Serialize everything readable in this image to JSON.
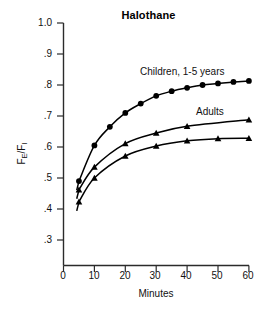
{
  "chart": {
    "title": "Halothane",
    "xlabel": "Minutes",
    "ylabel_main": "F",
    "ylabel_sub1": "E",
    "ylabel_mid": "/F",
    "ylabel_sub2": "I",
    "ylabel_full": "FE/FI"
  },
  "axes": {
    "y_ticks": [
      "1.0",
      ".9",
      ".8",
      ".7",
      ".6",
      ".5",
      ".4",
      ".3"
    ],
    "x_ticks": [
      "0",
      "10",
      "20",
      "30",
      "40",
      "50",
      "60"
    ]
  },
  "labels": {
    "children": "Children, 1-5 years",
    "adults": "Adults"
  },
  "colors": {
    "ink": "#000000",
    "axis": "#333333",
    "background": "#ffffff"
  },
  "chart_data": {
    "type": "line",
    "title": "Halothane",
    "xlabel": "Minutes",
    "ylabel": "FE/FI",
    "xlim": [
      0,
      60
    ],
    "ylim": [
      0.26,
      1.0
    ],
    "grid": false,
    "legend": "inline-annotations",
    "xticks": [
      0,
      10,
      20,
      30,
      40,
      50,
      60
    ],
    "yticks": [
      0.3,
      0.4,
      0.5,
      0.6,
      0.7,
      0.8,
      0.9,
      1.0
    ],
    "series": [
      {
        "name": "Children, 1-5 years",
        "marker": "circle",
        "x": [
          5,
          10,
          15,
          20,
          25,
          30,
          35,
          40,
          45,
          50,
          55,
          60
        ],
        "values": [
          0.49,
          0.605,
          0.665,
          0.71,
          0.74,
          0.765,
          0.78,
          0.791,
          0.8,
          0.805,
          0.81,
          0.813
        ]
      },
      {
        "name": "Adults",
        "marker": "triangle",
        "x": [
          5,
          10,
          20,
          30,
          40,
          60
        ],
        "values": [
          0.462,
          0.535,
          0.611,
          0.645,
          0.667,
          0.688
        ]
      },
      {
        "name": "Lower series",
        "marker": "triangle",
        "x": [
          5,
          10,
          20,
          30,
          40,
          50,
          60
        ],
        "values": [
          0.423,
          0.5,
          0.571,
          0.603,
          0.62,
          0.627,
          0.628
        ]
      }
    ]
  }
}
